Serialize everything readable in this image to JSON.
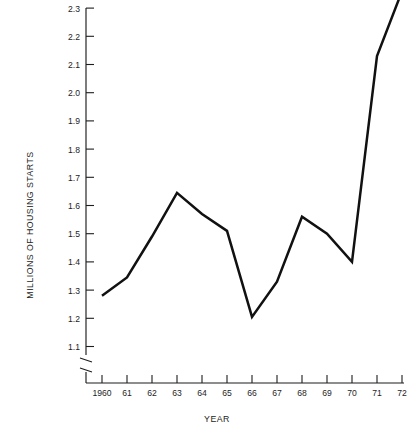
{
  "chart_data": {
    "type": "line",
    "title": "",
    "xlabel": "YEAR",
    "ylabel": "MILLIONS OF HOUSING STARTS",
    "categories": [
      "1960",
      "61",
      "62",
      "63",
      "64",
      "65",
      "66",
      "67",
      "68",
      "69",
      "70",
      "71",
      "72"
    ],
    "x": [
      1960,
      1961,
      1962,
      1963,
      1964,
      1965,
      1966,
      1967,
      1968,
      1969,
      1970,
      1971,
      1972
    ],
    "values": [
      1.28,
      1.345,
      1.49,
      1.645,
      1.57,
      1.51,
      1.205,
      1.33,
      1.56,
      1.5,
      1.4,
      2.13,
      2.36
    ],
    "series": [
      {
        "name": "Housing starts",
        "values": [
          1.28,
          1.345,
          1.49,
          1.645,
          1.57,
          1.51,
          1.205,
          1.33,
          1.56,
          1.5,
          1.4,
          2.13,
          2.36
        ]
      }
    ],
    "ylim": [
      1.1,
      2.4
    ],
    "xlim": [
      1960,
      1972
    ],
    "ytick_labels": [
      "1.1",
      "1.2",
      "1.3",
      "1.4",
      "1.5",
      "1.6",
      "1.7",
      "1.8",
      "1.9",
      "2.0",
      "2.1",
      "2.2",
      "2.3"
    ],
    "ytick_values": [
      1.1,
      1.2,
      1.3,
      1.4,
      1.5,
      1.6,
      1.7,
      1.8,
      1.9,
      2.0,
      2.1,
      2.2,
      2.3
    ],
    "grid": false,
    "legend": null,
    "axis_break": {
      "axis": "y",
      "below": "1.1",
      "style": "zigzag"
    },
    "line_color": "#111111"
  },
  "axes": {
    "y_title": "MILLIONS OF HOUSING STARTS",
    "x_title": "YEAR"
  }
}
